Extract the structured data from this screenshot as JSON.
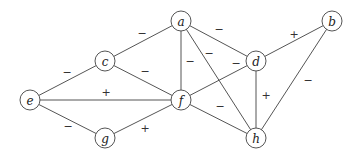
{
  "diagram": {
    "type": "signed-graph",
    "nodes": [
      {
        "id": "a",
        "label": "a",
        "x": 181,
        "y": 21
      },
      {
        "id": "b",
        "label": "b",
        "x": 332,
        "y": 21
      },
      {
        "id": "c",
        "label": "c",
        "x": 105,
        "y": 61
      },
      {
        "id": "d",
        "label": "d",
        "x": 256,
        "y": 61
      },
      {
        "id": "e",
        "label": "e",
        "x": 30,
        "y": 100
      },
      {
        "id": "f",
        "label": "f",
        "x": 181,
        "y": 100
      },
      {
        "id": "g",
        "label": "g",
        "x": 105,
        "y": 138
      },
      {
        "id": "h",
        "label": "h",
        "x": 256,
        "h_note": "",
        "y": 138
      }
    ],
    "edges": [
      {
        "from": "a",
        "to": "c",
        "sign": "−",
        "lx": 142,
        "ly": 34
      },
      {
        "from": "a",
        "to": "d",
        "sign": "−",
        "lx": 219,
        "ly": 30
      },
      {
        "from": "a",
        "to": "f",
        "sign": "−",
        "lx": 190,
        "ly": 62
      },
      {
        "from": "a",
        "to": "h",
        "sign": "−",
        "lx": 209,
        "ly": 54
      },
      {
        "from": "c",
        "to": "e",
        "sign": "−",
        "lx": 67,
        "ly": 73
      },
      {
        "from": "c",
        "to": "f",
        "sign": "−",
        "lx": 145,
        "ly": 72
      },
      {
        "from": "e",
        "to": "f",
        "sign": "+",
        "lx": 106,
        "ly": 93
      },
      {
        "from": "e",
        "to": "g",
        "sign": "−",
        "lx": 68,
        "ly": 127
      },
      {
        "from": "g",
        "to": "f",
        "sign": "+",
        "lx": 145,
        "ly": 129
      },
      {
        "from": "f",
        "to": "d",
        "sign": "−",
        "lx": 236,
        "ly": 64
      },
      {
        "from": "f",
        "to": "h",
        "sign": "−",
        "lx": 220,
        "ly": 107
      },
      {
        "from": "d",
        "to": "b",
        "sign": "+",
        "lx": 294,
        "ly": 35
      },
      {
        "from": "d",
        "to": "h",
        "sign": "+",
        "lx": 266,
        "ly": 96
      },
      {
        "from": "b",
        "to": "h",
        "sign": "−",
        "lx": 308,
        "ly": 81
      }
    ]
  }
}
